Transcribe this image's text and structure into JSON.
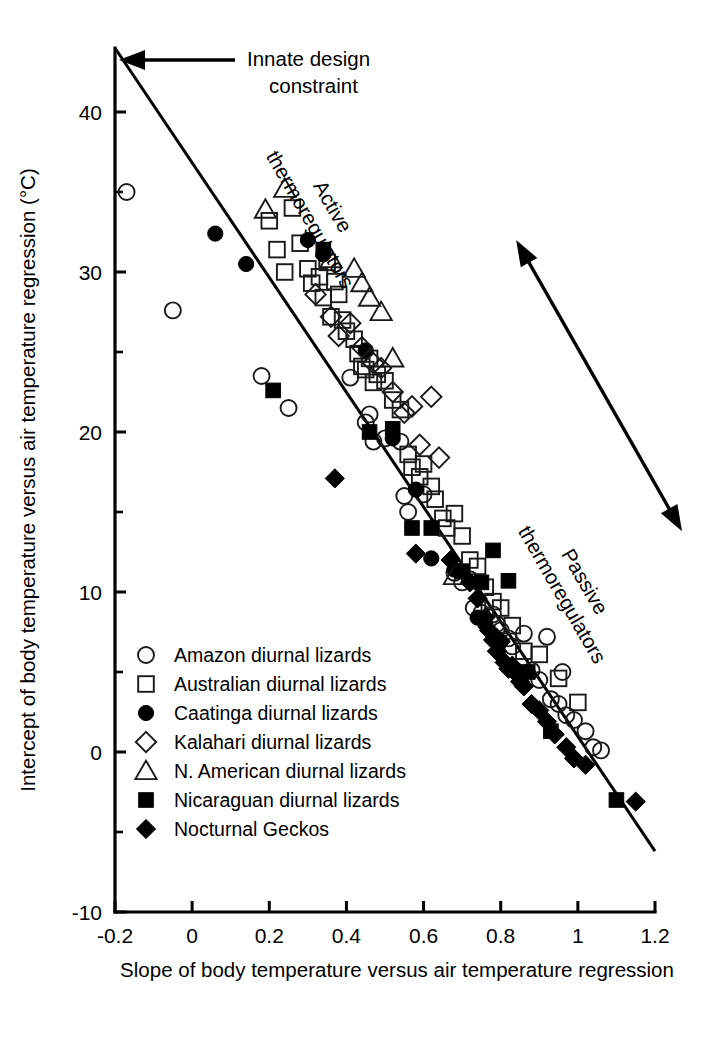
{
  "chart_data": {
    "type": "scatter",
    "title": "",
    "xlabel": "Slope of body temperature versus air temperature regression",
    "ylabel": "Intercept of body temperature versus air temperature regression (°C)",
    "xlim": [
      -0.2,
      1.2
    ],
    "ylim": [
      -10,
      44
    ],
    "grid": false,
    "legend_position": "lower-left-inside",
    "x_ticks": [
      "-0.2",
      "0",
      "0.2",
      "0.4",
      "0.6",
      "0.8",
      "1",
      "1.2"
    ],
    "x_tick_values": [
      -0.2,
      0,
      0.2,
      0.4,
      0.6,
      0.8,
      1.0,
      1.2
    ],
    "y_ticks": [
      "-10",
      "0",
      "10",
      "20",
      "30",
      "40"
    ],
    "y_tick_values": [
      -10,
      0,
      10,
      20,
      30,
      40
    ],
    "y_minor_tick_values": [
      -5,
      5,
      15,
      25,
      35
    ],
    "annotations": [
      {
        "name": "innate-design-constraint",
        "text_line1": "Innate design",
        "text_line2": "constraint",
        "arrow": "left",
        "points_to_x": -0.2,
        "points_to_y": 44
      },
      {
        "name": "active-thermoregulators",
        "text_line1": "Active",
        "text_line2": "thermoregulators",
        "rotation_deg": 60
      },
      {
        "name": "passive-thermoregulators",
        "text_line1": "Passive",
        "text_line2": "thermoregulators",
        "rotation_deg": 60
      },
      {
        "name": "thermoregulation-gradient-arrow",
        "type": "double-headed-arrow",
        "from_x": 0.84,
        "from_y": 32.0,
        "to_x": 1.27,
        "to_y": 13.8
      }
    ],
    "trendline": {
      "name": "regression-line",
      "x_start": -0.2,
      "y_start": 44.0,
      "x_end": 1.2,
      "y_end": -6.2,
      "slope": -35.86,
      "intercept": 36.83
    },
    "series": [
      {
        "name": "Amazon diurnal lizards",
        "marker": "circle-open",
        "filled": false,
        "points": [
          [
            -0.17,
            35.0
          ],
          [
            -0.05,
            27.6
          ],
          [
            0.18,
            23.5
          ],
          [
            0.25,
            21.5
          ],
          [
            0.41,
            23.4
          ],
          [
            0.45,
            20.6
          ],
          [
            0.46,
            21.1
          ],
          [
            0.47,
            19.4
          ],
          [
            0.5,
            19.6
          ],
          [
            0.54,
            19.4
          ],
          [
            0.55,
            16.0
          ],
          [
            0.56,
            15.0
          ],
          [
            0.6,
            16.1
          ],
          [
            0.68,
            11.2
          ],
          [
            0.7,
            10.6
          ],
          [
            0.72,
            10.8
          ],
          [
            0.73,
            9.0
          ],
          [
            0.75,
            8.7
          ],
          [
            0.78,
            8.6
          ],
          [
            0.79,
            8.0
          ],
          [
            0.8,
            7.6
          ],
          [
            0.82,
            7.1
          ],
          [
            0.83,
            6.6
          ],
          [
            0.86,
            7.4
          ],
          [
            0.88,
            5.1
          ],
          [
            0.9,
            4.5
          ],
          [
            0.92,
            7.2
          ],
          [
            0.93,
            3.3
          ],
          [
            0.95,
            3.0
          ],
          [
            0.96,
            5.0
          ],
          [
            0.97,
            2.3
          ],
          [
            0.99,
            2.0
          ],
          [
            1.02,
            1.3
          ],
          [
            1.04,
            0.3
          ],
          [
            1.06,
            0.1
          ]
        ]
      },
      {
        "name": "Australian diurnal lizards",
        "marker": "square-open",
        "filled": false,
        "points": [
          [
            0.2,
            33.2
          ],
          [
            0.22,
            31.4
          ],
          [
            0.24,
            30.0
          ],
          [
            0.26,
            34.0
          ],
          [
            0.28,
            31.8
          ],
          [
            0.3,
            30.2
          ],
          [
            0.31,
            29.3
          ],
          [
            0.33,
            29.7
          ],
          [
            0.34,
            28.4
          ],
          [
            0.35,
            30.6
          ],
          [
            0.36,
            27.2
          ],
          [
            0.37,
            29.4
          ],
          [
            0.38,
            28.6
          ],
          [
            0.39,
            27.0
          ],
          [
            0.4,
            26.3
          ],
          [
            0.42,
            25.8
          ],
          [
            0.43,
            24.9
          ],
          [
            0.44,
            24.1
          ],
          [
            0.45,
            23.9
          ],
          [
            0.46,
            24.6
          ],
          [
            0.47,
            23.1
          ],
          [
            0.48,
            23.6
          ],
          [
            0.5,
            23.2
          ],
          [
            0.52,
            22.0
          ],
          [
            0.54,
            21.4
          ],
          [
            0.56,
            18.6
          ],
          [
            0.57,
            17.8
          ],
          [
            0.59,
            17.2
          ],
          [
            0.6,
            18.0
          ],
          [
            0.62,
            16.6
          ],
          [
            0.63,
            15.8
          ],
          [
            0.65,
            14.6
          ],
          [
            0.66,
            14.0
          ],
          [
            0.68,
            14.9
          ],
          [
            0.7,
            13.5
          ],
          [
            0.72,
            12.0
          ],
          [
            0.74,
            11.6
          ],
          [
            0.76,
            10.3
          ],
          [
            0.78,
            9.4
          ],
          [
            0.8,
            9.0
          ],
          [
            0.83,
            7.9
          ],
          [
            0.86,
            6.3
          ],
          [
            0.9,
            6.1
          ],
          [
            0.95,
            4.6
          ],
          [
            1.0,
            3.1
          ]
        ]
      },
      {
        "name": "Caatinga diurnal lizards",
        "marker": "circle-filled",
        "filled": true,
        "points": [
          [
            0.06,
            32.4
          ],
          [
            0.14,
            30.5
          ],
          [
            0.3,
            32.0
          ],
          [
            0.34,
            31.1
          ],
          [
            0.45,
            25.1
          ],
          [
            0.52,
            19.6
          ],
          [
            0.58,
            16.4
          ],
          [
            0.62,
            12.1
          ],
          [
            0.68,
            11.4
          ],
          [
            0.74,
            8.4
          ],
          [
            0.76,
            8.0
          ],
          [
            0.78,
            7.3
          ],
          [
            0.8,
            6.9
          ]
        ]
      },
      {
        "name": "Kalahari diurnal lizards",
        "marker": "diamond-open",
        "filled": false,
        "points": [
          [
            0.32,
            28.6
          ],
          [
            0.36,
            27.2
          ],
          [
            0.38,
            26.0
          ],
          [
            0.41,
            26.8
          ],
          [
            0.44,
            25.3
          ],
          [
            0.47,
            24.3
          ],
          [
            0.49,
            24.0
          ],
          [
            0.52,
            22.5
          ],
          [
            0.55,
            21.2
          ],
          [
            0.57,
            21.6
          ],
          [
            0.59,
            19.2
          ],
          [
            0.62,
            22.2
          ],
          [
            0.64,
            18.4
          ]
        ]
      },
      {
        "name": "N. American diurnal lizards",
        "marker": "triangle-open",
        "filled": false,
        "points": [
          [
            0.19,
            33.9
          ],
          [
            0.24,
            35.2
          ],
          [
            0.36,
            30.8
          ],
          [
            0.42,
            30.2
          ],
          [
            0.44,
            29.3
          ],
          [
            0.46,
            28.4
          ],
          [
            0.49,
            27.5
          ],
          [
            0.52,
            24.6
          ],
          [
            0.68,
            11.0
          ]
        ]
      },
      {
        "name": "Nicaraguan diurnal lizards",
        "marker": "square-filled",
        "filled": true,
        "points": [
          [
            0.21,
            22.6
          ],
          [
            0.34,
            31.4
          ],
          [
            0.46,
            20.0
          ],
          [
            0.52,
            20.2
          ],
          [
            0.57,
            14.0
          ],
          [
            0.62,
            14.0
          ],
          [
            0.7,
            11.3
          ],
          [
            0.75,
            10.6
          ],
          [
            0.78,
            12.6
          ],
          [
            0.82,
            10.7
          ],
          [
            0.87,
            5.0
          ],
          [
            0.93,
            1.3
          ],
          [
            1.1,
            -3.0
          ]
        ]
      },
      {
        "name": "Nocturnal Geckos",
        "marker": "diamond-filled",
        "filled": true,
        "points": [
          [
            0.37,
            17.1
          ],
          [
            0.58,
            12.4
          ],
          [
            0.67,
            12.0
          ],
          [
            0.72,
            10.6
          ],
          [
            0.74,
            9.6
          ],
          [
            0.76,
            8.4
          ],
          [
            0.77,
            7.6
          ],
          [
            0.78,
            7.0
          ],
          [
            0.79,
            6.3
          ],
          [
            0.8,
            6.9
          ],
          [
            0.81,
            5.6
          ],
          [
            0.82,
            5.2
          ],
          [
            0.83,
            5.4
          ],
          [
            0.84,
            4.9
          ],
          [
            0.85,
            4.4
          ],
          [
            0.86,
            4.1
          ],
          [
            0.88,
            3.0
          ],
          [
            0.9,
            2.6
          ],
          [
            0.92,
            1.9
          ],
          [
            0.94,
            1.1
          ],
          [
            0.97,
            0.3
          ],
          [
            0.99,
            -0.4
          ],
          [
            1.02,
            -0.8
          ],
          [
            1.15,
            -3.1
          ]
        ]
      }
    ]
  },
  "legend": {
    "name": "series-legend",
    "entries": [
      {
        "marker": "circle-open",
        "label": "Amazon diurnal lizards"
      },
      {
        "marker": "square-open",
        "label": "Australian diurnal lizards"
      },
      {
        "marker": "circle-filled",
        "label": "Caatinga diurnal lizards"
      },
      {
        "marker": "diamond-open",
        "label": "Kalahari diurnal lizards"
      },
      {
        "marker": "triangle-open",
        "label": "N. American diurnal lizards"
      },
      {
        "marker": "square-filled",
        "label": "Nicaraguan diurnal lizards"
      },
      {
        "marker": "diamond-filled",
        "label": "Nocturnal Geckos"
      }
    ]
  },
  "colors": {
    "ink": "#000000",
    "background": "#ffffff",
    "marker_outline": "#1a1a1a"
  }
}
